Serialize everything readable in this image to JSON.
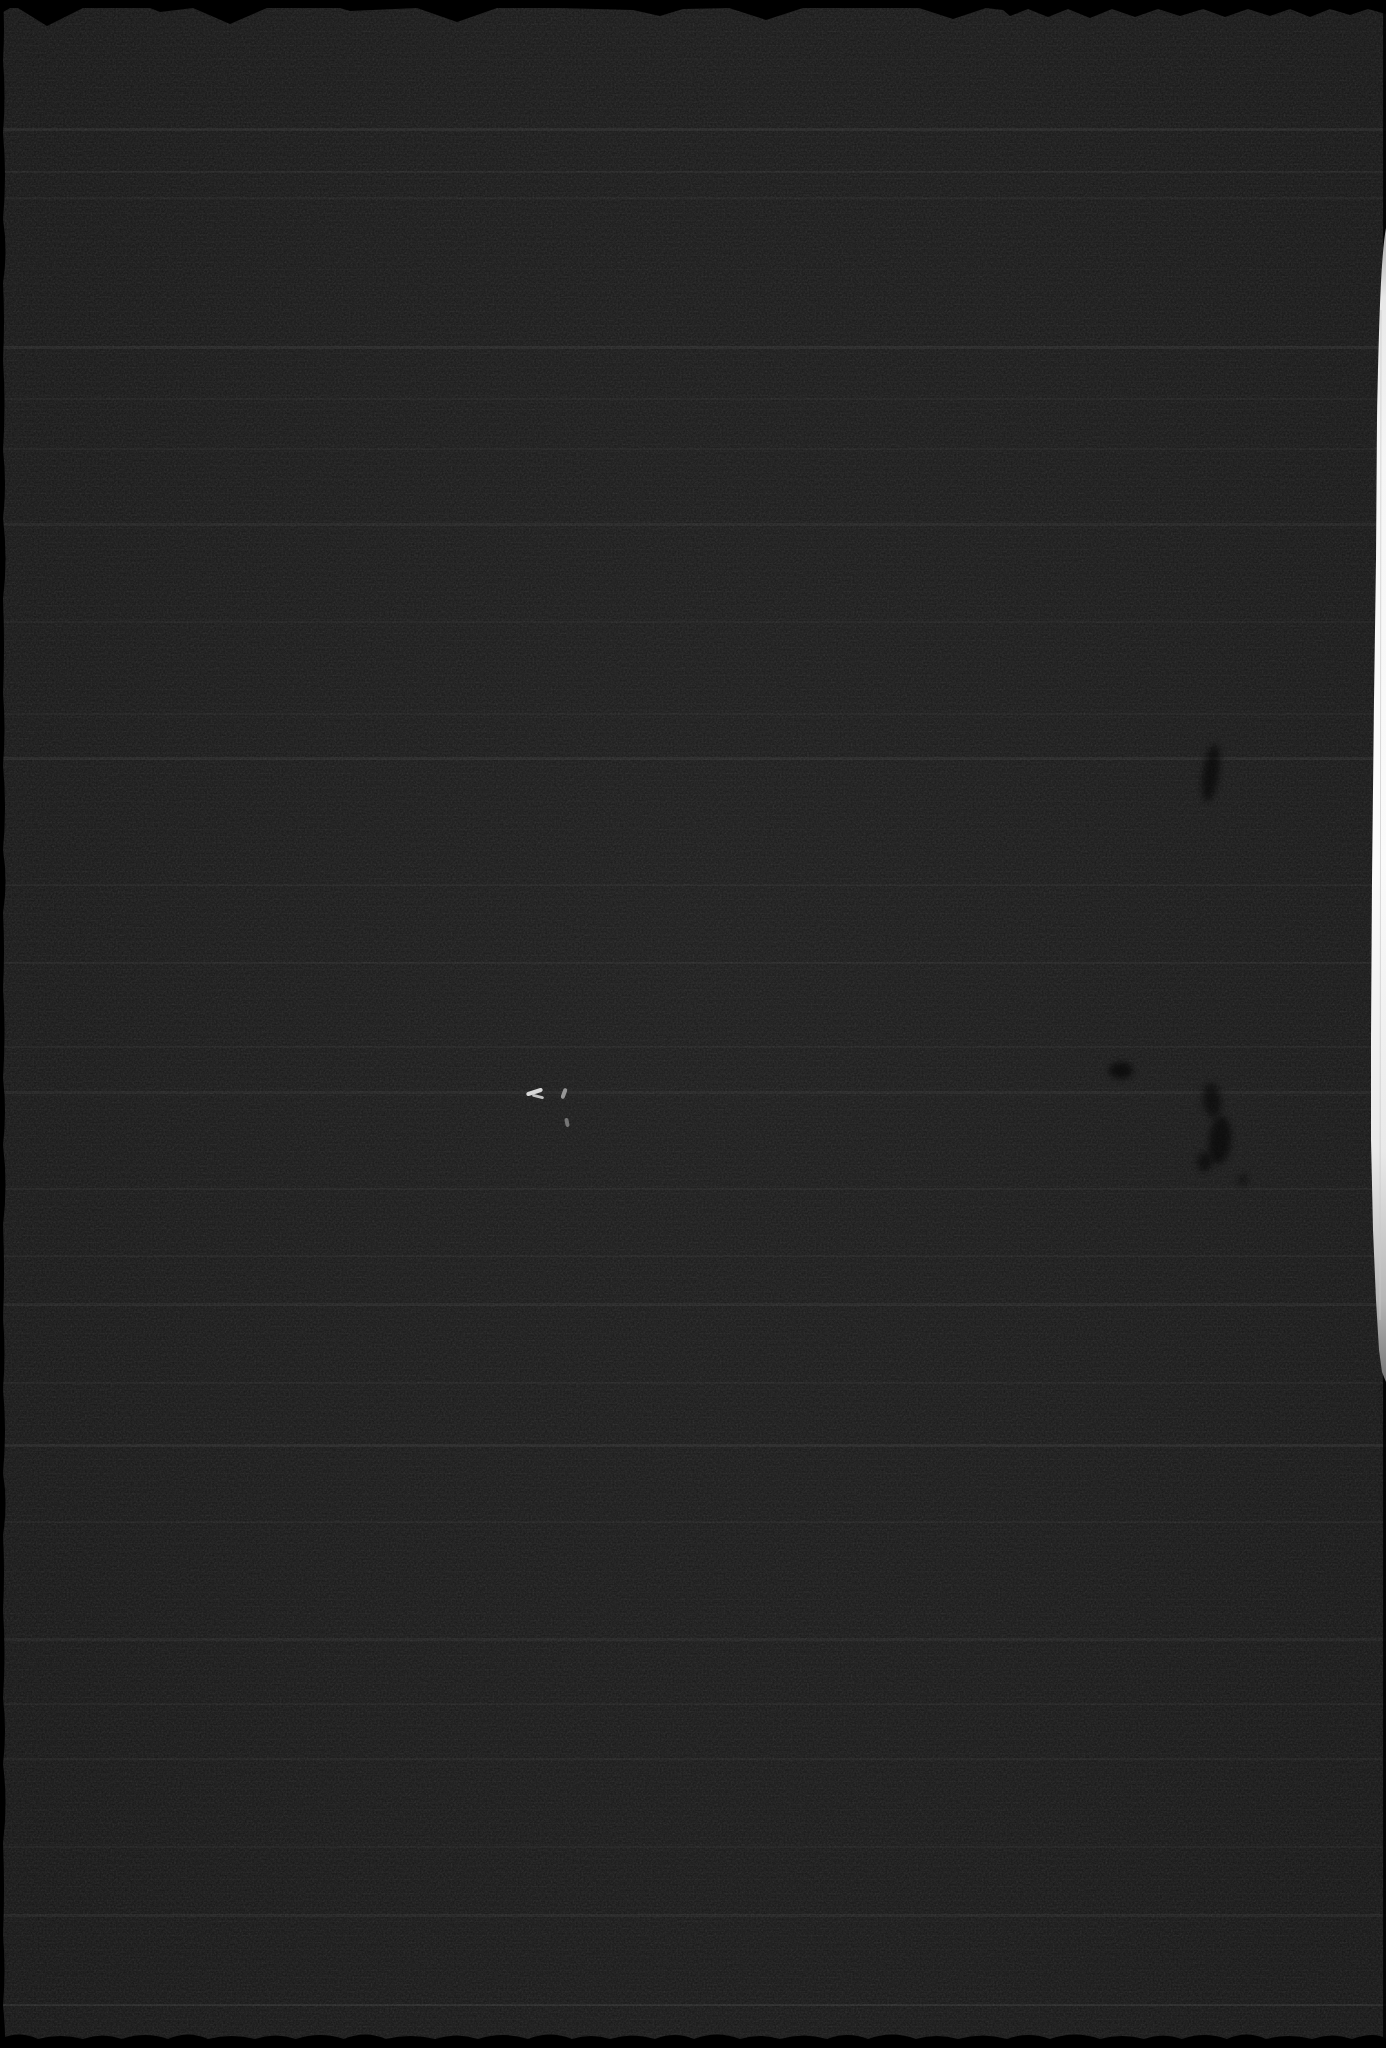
{
  "scan": {
    "colors": {
      "background": "#191919",
      "edge_black": "#000000",
      "paper_gap_white": "#f6f6f6",
      "scratch_white": "#dcdcdc"
    },
    "right_paper_gap": {
      "top_y": 228,
      "bottom_y": 1382,
      "max_width_px": 15,
      "color": "#f6f6f6"
    },
    "artifacts": {
      "white_scratches": [
        {
          "x": 526,
          "y": 1090,
          "width": 17,
          "height": 4,
          "rotation": -18,
          "color": "#e2e2e2",
          "opacity": 0.95
        },
        {
          "x": 532,
          "y": 1095,
          "width": 12,
          "height": 3,
          "rotation": 14,
          "color": "#d0d0d0",
          "opacity": 0.9
        },
        {
          "x": 562,
          "y": 1088,
          "width": 4,
          "height": 11,
          "rotation": 20,
          "color": "#b2b2b2",
          "opacity": 0.8
        },
        {
          "x": 565,
          "y": 1118,
          "width": 4,
          "height": 9,
          "rotation": -12,
          "color": "#979797",
          "opacity": 0.7
        }
      ],
      "dark_smudges": [
        {
          "x": 1203,
          "y": 744,
          "width": 16,
          "height": 58,
          "rotation": 8,
          "opacity": 0.55
        },
        {
          "x": 1109,
          "y": 1062,
          "width": 24,
          "height": 17,
          "rotation": 0,
          "opacity": 0.6
        },
        {
          "x": 1203,
          "y": 1083,
          "width": 18,
          "height": 34,
          "rotation": -6,
          "opacity": 0.5
        },
        {
          "x": 1209,
          "y": 1116,
          "width": 22,
          "height": 48,
          "rotation": 5,
          "opacity": 0.55
        },
        {
          "x": 1197,
          "y": 1152,
          "width": 15,
          "height": 20,
          "rotation": 0,
          "opacity": 0.5
        },
        {
          "x": 1238,
          "y": 1174,
          "width": 10,
          "height": 12,
          "rotation": 0,
          "opacity": 0.4
        }
      ],
      "streak_lines": [
        {
          "y": 128,
          "height": 3,
          "opacity": 0.05
        },
        {
          "y": 171,
          "height": 2,
          "opacity": 0.04
        },
        {
          "y": 197,
          "height": 2,
          "opacity": 0.035
        },
        {
          "y": 346,
          "height": 3,
          "opacity": 0.05
        },
        {
          "y": 398,
          "height": 2,
          "opacity": 0.03
        },
        {
          "y": 448,
          "height": 2,
          "opacity": 0.03
        },
        {
          "y": 523,
          "height": 3,
          "opacity": 0.045
        },
        {
          "y": 621,
          "height": 2,
          "opacity": 0.03
        },
        {
          "y": 713,
          "height": 2,
          "opacity": 0.03
        },
        {
          "y": 757,
          "height": 3,
          "opacity": 0.05
        },
        {
          "y": 884,
          "height": 2,
          "opacity": 0.03
        },
        {
          "y": 962,
          "height": 2,
          "opacity": 0.04
        },
        {
          "y": 1046,
          "height": 2,
          "opacity": 0.03
        },
        {
          "y": 1091,
          "height": 3,
          "opacity": 0.045
        },
        {
          "y": 1188,
          "height": 2,
          "opacity": 0.04
        },
        {
          "y": 1255,
          "height": 2,
          "opacity": 0.03
        },
        {
          "y": 1303,
          "height": 3,
          "opacity": 0.045
        },
        {
          "y": 1382,
          "height": 2,
          "opacity": 0.03
        },
        {
          "y": 1444,
          "height": 3,
          "opacity": 0.05
        },
        {
          "y": 1521,
          "height": 2,
          "opacity": 0.03
        },
        {
          "y": 1638,
          "height": 3,
          "opacity": 0.045
        },
        {
          "y": 1703,
          "height": 2,
          "opacity": 0.03
        },
        {
          "y": 1758,
          "height": 2,
          "opacity": 0.04
        },
        {
          "y": 1846,
          "height": 2,
          "opacity": 0.03
        },
        {
          "y": 1914,
          "height": 3,
          "opacity": 0.045
        },
        {
          "y": 2004,
          "height": 2,
          "opacity": 0.065
        }
      ]
    }
  }
}
